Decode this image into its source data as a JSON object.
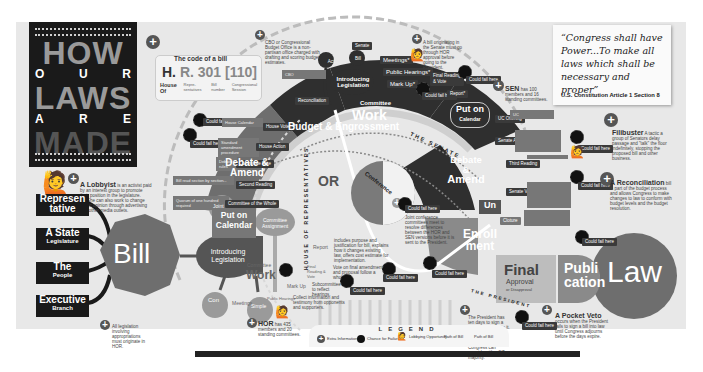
{
  "title": {
    "line1": "HOW",
    "line2": [
      "O",
      "U",
      "R"
    ],
    "line3": "LAWS",
    "line4": [
      "A",
      "R",
      "E"
    ],
    "line5": "MADE"
  },
  "bill_code": {
    "heading": "The code of a bill",
    "code_prefix": "H.",
    "code_rest": "R. 301 [110]",
    "parts": [
      "House Of",
      "Repre-sentatives",
      "Bill number",
      "Congressional Session"
    ]
  },
  "notes": {
    "cbo": "CBO or Congressional Budget Office is a non-partisan office charged with drafting and scoring budget estimates.",
    "lobbyist_title": "A Lobbyist",
    "lobbyist": "is an activist paid by an interest group to promote their position in the legislature. He/She can also work to change public opinion through advertising and other media outlets.",
    "all_legislation": "All legislation involving appropriations must originate in HOR.",
    "hor_title": "HOR",
    "hor": "has 435 members and 20 standing committees.",
    "sen_title": "SEN",
    "sen": "has 100 members and 16 standing committees.",
    "senate_bill": "A bill originating in the Senate must go through HOR approval before going to the President.",
    "filibuster_title": "Filibuster",
    "filibuster": "A tactic a group of Senators delay passage and \"talk\" the floor indefinitely, stopping the proposed bill and other business.",
    "reconciliation_title": "A Reconciliation",
    "reconciliation": "bill is part of the budget process and allows Congress to make changes to law to conform with budget levels and the budget resolution.",
    "pocket_veto_title": "A Pocket Veto",
    "pocket_veto": "occurs when the President fails to sign a bill into law until Congress adjourns before the days expire.",
    "president": "The President has ten days to sign a bill into law or veto it. If the bill automatically becomes a law. Congress can override with a 2/3 majority.",
    "conference": "Joint conference committees meet to resolve differences between the HOR and SEN versions before it is sent to the President.",
    "report": "includes purpose and justification for bill, explains how it changes existing law, offers cost estimate for implementation.",
    "final_amend": "Vote on final amendments and proposal follow a whole.",
    "subcommittee": "Subcommittee to reflect hearings.",
    "public_hearings": "Collect information and testimony from opponents and supporters."
  },
  "sources": [
    {
      "label": "Represen tative",
      "sub": ""
    },
    {
      "label": "A State",
      "sub": "Legislature"
    },
    {
      "label": "The",
      "sub": "People"
    },
    {
      "label": "Executive",
      "sub": "Branch"
    }
  ],
  "bill_label": "Bill",
  "law_label": "Law",
  "intro": {
    "label": "Introducing Legislation",
    "joint": "Joint",
    "con": "Con",
    "simple": "Simple",
    "assignment": "Committee Assignment"
  },
  "house_flow": {
    "committee_work": "Committee",
    "committee_work_big": "Work",
    "steps": [
      "Meetings",
      "Public Hearings",
      "Mark Up",
      "Final Reading & Vote",
      "Report"
    ],
    "put_on_calendar": "Put on Calendar",
    "debate_amend": "Debate & Amend",
    "budget": "Budget & Engrossment"
  },
  "arc_labels": {
    "house": "HOUSE OF REPRESENTATIVES",
    "senate": "THE SENATE",
    "president": "THE PRESIDENT"
  },
  "top_flow": {
    "act": "Act",
    "bill": "Bill",
    "senate": "Senate",
    "intro": "Introducing Legislation",
    "meetings": "Meetings*",
    "public_hearings": "Public Hearings*",
    "mark_up": "Mark Up*",
    "committee": "Committee",
    "work": "Work",
    "put_on": "Put on",
    "calendar": "Calendar",
    "report": "Report*",
    "final": "Final Reading & Vote"
  },
  "senate_flow": {
    "debate": "Debate &",
    "amend": "Amend",
    "steps": [
      "UC Offering",
      "Senate Action",
      "Third Reading",
      "Senate Vote",
      "Cloture",
      "Un"
    ],
    "enroll1": "Enroll",
    "enroll2": "ment"
  },
  "center": {
    "or": "OR",
    "conference": "Conference"
  },
  "final_approval": {
    "big": "Final",
    "mid": "Approval",
    "small": "or Disapproval"
  },
  "publication": {
    "line1": "Publi",
    "line2": "cation"
  },
  "left_tags": [
    {
      "chance": "Could fail here",
      "label": "House Calendar",
      "tag": "House Vote"
    },
    {
      "chance": "Could fail here",
      "label": "Standard amendment procedure",
      "tag": "House Action"
    },
    {
      "chance": "",
      "label": "Debate rules",
      "tag": "Committee Rise"
    },
    {
      "chance": "",
      "label": "Bill read section by section...",
      "tag": "Second Reading"
    },
    {
      "chance": "",
      "label": "Quorum of one hundred required",
      "tag": "Committee of the Whole"
    }
  ],
  "chance_tag": "Could fail here",
  "quote": {
    "text": "“Congress shall have Power...To make all laws which shall be necessary and proper”",
    "source": "U.S. Constitution Article 1 Section 8"
  },
  "legend": {
    "title": "LEGEND",
    "items": [
      "Extra Information",
      "Chance for Failure",
      "Lobbying Opportunity",
      "Path of Bill",
      "Path of Bill"
    ]
  },
  "colors": {
    "dark": "#2f2f2f",
    "mid": "#6e6e6e",
    "light": "#9a9a9a",
    "bg": "#e8e8e8"
  }
}
